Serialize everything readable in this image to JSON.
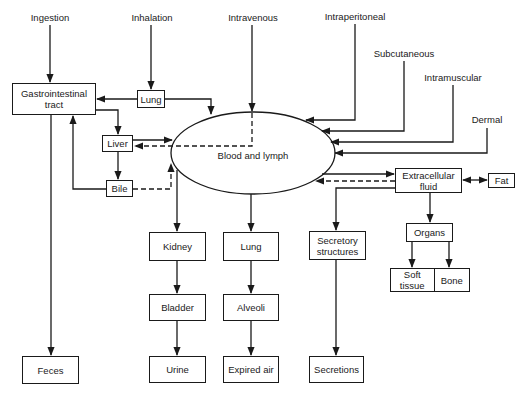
{
  "diagram": {
    "routes": {
      "ingestion": "Ingestion",
      "inhalation": "Inhalation",
      "intravenous": "Intravenous",
      "intraperitoneal": "Intraperitoneal",
      "subcutaneous": "Subcutaneous",
      "intramuscular": "Intramuscular",
      "dermal": "Dermal"
    },
    "central": "Blood and lymph",
    "nodes": {
      "gi_tract": "Gastrointestinal tract",
      "lung_absorption": "Lung",
      "liver": "Liver",
      "bile": "Bile",
      "extracellular_fluid": "Extracellular fluid",
      "fat": "Fat",
      "organs": "Organs",
      "soft_tissue": "Soft tissue",
      "bone": "Bone",
      "kidney": "Kidney",
      "bladder": "Bladder",
      "urine": "Urine",
      "lung_excretion": "Lung",
      "alveoli": "Alveoli",
      "expired_air": "Expired air",
      "secretory_structures": "Secretory structures",
      "secretions": "Secretions",
      "feces": "Feces"
    },
    "edges": [
      {
        "from": "Ingestion",
        "to": "Gastrointestinal tract",
        "style": "solid"
      },
      {
        "from": "Inhalation",
        "to": "Lung",
        "style": "solid"
      },
      {
        "from": "Lung",
        "to": "Gastrointestinal tract",
        "style": "solid"
      },
      {
        "from": "Lung",
        "to": "Blood and lymph",
        "style": "solid"
      },
      {
        "from": "Intravenous",
        "to": "Blood and lymph",
        "style": "solid"
      },
      {
        "from": "Blood and lymph",
        "to": "Liver",
        "style": "dashed"
      },
      {
        "from": "Gastrointestinal tract",
        "to": "Liver",
        "style": "solid"
      },
      {
        "from": "Liver",
        "to": "Blood and lymph",
        "style": "solid"
      },
      {
        "from": "Liver",
        "to": "Bile",
        "style": "solid"
      },
      {
        "from": "Bile",
        "to": "Gastrointestinal tract",
        "style": "solid"
      },
      {
        "from": "Bile",
        "to": "Blood and lymph",
        "style": "dashed"
      },
      {
        "from": "Intraperitoneal",
        "to": "Blood and lymph",
        "style": "solid"
      },
      {
        "from": "Subcutaneous",
        "to": "Blood and lymph",
        "style": "solid"
      },
      {
        "from": "Intramuscular",
        "to": "Blood and lymph",
        "style": "solid"
      },
      {
        "from": "Dermal",
        "to": "Blood and lymph",
        "style": "solid"
      },
      {
        "from": "Blood and lymph",
        "to": "Extracellular fluid",
        "style": "solid"
      },
      {
        "from": "Extracellular fluid",
        "to": "Blood and lymph",
        "style": "dashed"
      },
      {
        "from": "Extracellular fluid",
        "to": "Fat",
        "style": "bidirectional"
      },
      {
        "from": "Extracellular fluid",
        "to": "Organs",
        "style": "solid"
      },
      {
        "from": "Extracellular fluid",
        "to": "Secretory structures",
        "style": "solid"
      },
      {
        "from": "Organs",
        "to": "Soft tissue",
        "style": "solid"
      },
      {
        "from": "Organs",
        "to": "Bone",
        "style": "solid"
      },
      {
        "from": "Blood and lymph",
        "to": "Kidney",
        "style": "solid"
      },
      {
        "from": "Kidney",
        "to": "Bladder",
        "style": "solid"
      },
      {
        "from": "Bladder",
        "to": "Urine",
        "style": "solid"
      },
      {
        "from": "Blood and lymph",
        "to": "Lung",
        "style": "solid"
      },
      {
        "from": "Lung",
        "to": "Alveoli",
        "style": "solid"
      },
      {
        "from": "Alveoli",
        "to": "Expired air",
        "style": "solid"
      },
      {
        "from": "Secretory structures",
        "to": "Secretions",
        "style": "solid"
      },
      {
        "from": "Gastrointestinal tract",
        "to": "Feces",
        "style": "solid"
      }
    ]
  }
}
